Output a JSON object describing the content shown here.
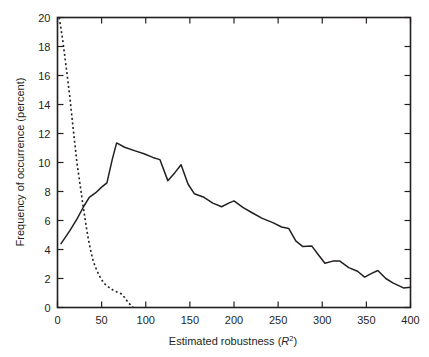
{
  "chart_data": {
    "type": "line",
    "title": "",
    "xlabel": "Estimated robustness (R2)",
    "xlabel_prefix": "Estimated robustness (",
    "xlabel_var": "R",
    "xlabel_sup": "2",
    "xlabel_suffix": ")",
    "ylabel": "Frequency of occurrence (percent)",
    "xlim": [
      0,
      400
    ],
    "ylim": [
      0,
      20
    ],
    "xticks": [
      0,
      50,
      100,
      150,
      200,
      250,
      300,
      350,
      400
    ],
    "xtick_labels": [
      "0",
      "50",
      "100",
      "150",
      "200",
      "250",
      "300",
      "350",
      "400"
    ],
    "yticks": [
      0,
      2,
      4,
      6,
      8,
      10,
      12,
      14,
      16,
      18,
      20
    ],
    "ytick_labels": [
      "0",
      "2",
      "4",
      "6",
      "8",
      "10",
      "12",
      "14",
      "16",
      "18",
      "20"
    ],
    "grid": false,
    "legend": "none",
    "box_frame": true,
    "tick_direction": "in",
    "series": [
      {
        "name": "solid-curve",
        "style": "solid",
        "color": "#231f20",
        "points": [
          [
            4,
            4.4
          ],
          [
            14,
            5.3
          ],
          [
            22,
            6.1
          ],
          [
            30,
            7.0
          ],
          [
            36,
            7.6
          ],
          [
            43,
            7.9
          ],
          [
            50,
            8.3
          ],
          [
            56,
            8.6
          ],
          [
            62,
            10.2
          ],
          [
            67,
            11.35
          ],
          [
            76,
            11.05
          ],
          [
            88,
            10.8
          ],
          [
            98,
            10.6
          ],
          [
            108,
            10.35
          ],
          [
            116,
            10.2
          ],
          [
            125,
            8.75
          ],
          [
            133,
            9.3
          ],
          [
            140,
            9.85
          ],
          [
            148,
            8.5
          ],
          [
            155,
            7.85
          ],
          [
            166,
            7.6
          ],
          [
            176,
            7.2
          ],
          [
            186,
            6.95
          ],
          [
            194,
            7.2
          ],
          [
            200,
            7.35
          ],
          [
            210,
            6.9
          ],
          [
            220,
            6.55
          ],
          [
            232,
            6.15
          ],
          [
            244,
            5.85
          ],
          [
            254,
            5.55
          ],
          [
            262,
            5.45
          ],
          [
            270,
            4.6
          ],
          [
            278,
            4.2
          ],
          [
            288,
            4.25
          ],
          [
            296,
            3.6
          ],
          [
            303,
            3.05
          ],
          [
            312,
            3.2
          ],
          [
            320,
            3.2
          ],
          [
            330,
            2.75
          ],
          [
            340,
            2.5
          ],
          [
            348,
            2.1
          ],
          [
            356,
            2.35
          ],
          [
            363,
            2.55
          ],
          [
            372,
            2.0
          ],
          [
            380,
            1.7
          ],
          [
            392,
            1.35
          ],
          [
            400,
            1.4
          ]
        ]
      },
      {
        "name": "dashed-curve",
        "style": "dashed",
        "color": "#231f20",
        "points": [
          [
            2,
            20.0
          ],
          [
            6,
            18.4
          ],
          [
            10,
            16.5
          ],
          [
            14,
            14.5
          ],
          [
            18,
            12.2
          ],
          [
            22,
            10.0
          ],
          [
            26,
            8.3
          ],
          [
            29,
            7.0
          ],
          [
            32,
            5.8
          ],
          [
            35,
            4.7
          ],
          [
            38,
            3.8
          ],
          [
            41,
            3.1
          ],
          [
            45,
            2.5
          ],
          [
            49,
            2.0
          ],
          [
            53,
            1.65
          ],
          [
            58,
            1.4
          ],
          [
            63,
            1.2
          ],
          [
            68,
            1.05
          ],
          [
            72,
            0.95
          ],
          [
            76,
            0.7
          ],
          [
            80,
            0.35
          ],
          [
            84,
            0.1
          ],
          [
            86,
            0.0
          ]
        ]
      }
    ]
  },
  "axes": {
    "y_axis_title": "Frequency of occurrence (percent)",
    "x_axis_title_full": "Estimated robustness (R2)"
  }
}
